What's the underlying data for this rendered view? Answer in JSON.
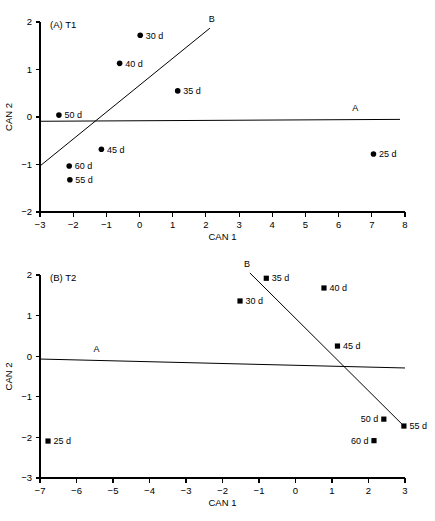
{
  "chart_data": [
    {
      "type": "scatter",
      "panel_id": "A",
      "panel_label": "(A) T1",
      "title": "(A) T1",
      "xlabel": "CAN 1",
      "ylabel": "CAN 2",
      "xlim": [
        -3,
        8
      ],
      "ylim": [
        -2,
        2
      ],
      "xticks": [
        -3,
        -2,
        -1,
        0,
        1,
        2,
        3,
        4,
        5,
        6,
        7,
        8
      ],
      "xticklabels": [
        "−3",
        "−2",
        "−1",
        "0",
        "1",
        "2",
        "3",
        "4",
        "5",
        "6",
        "7",
        "8"
      ],
      "yticks": [
        -2,
        -1,
        0,
        1,
        2
      ],
      "yticklabels": [
        "−2",
        "−1",
        "0",
        "1",
        "2"
      ],
      "grid": false,
      "legend": false,
      "marker": "circle",
      "points": [
        {
          "label": "25 d",
          "x": 7.05,
          "y": -0.78,
          "label_side": "right"
        },
        {
          "label": "30 d",
          "x": 0.02,
          "y": 1.72,
          "label_side": "right"
        },
        {
          "label": "35 d",
          "x": 1.15,
          "y": 0.55,
          "label_side": "right"
        },
        {
          "label": "40 d",
          "x": -0.6,
          "y": 1.13,
          "label_side": "right"
        },
        {
          "label": "45 d",
          "x": -1.15,
          "y": -0.68,
          "label_side": "right"
        },
        {
          "label": "50 d",
          "x": -2.43,
          "y": 0.04,
          "label_side": "right"
        },
        {
          "label": "55 d",
          "x": -2.1,
          "y": -1.32,
          "label_side": "right"
        },
        {
          "label": "60 d",
          "x": -2.12,
          "y": -1.03,
          "label_side": "right"
        }
      ],
      "vectors": [
        {
          "name": "A",
          "x1": -3.0,
          "y1": -0.09,
          "x2": 7.85,
          "y2": -0.05,
          "label": "A",
          "label_x": 6.5,
          "label_y": 0.12
        },
        {
          "name": "B",
          "x1": -2.98,
          "y1": -1.02,
          "x2": 2.12,
          "y2": 1.87,
          "label": "B",
          "label_x": 2.18,
          "label_y": 2.0
        }
      ]
    },
    {
      "type": "scatter",
      "panel_id": "B",
      "panel_label": "(B) T2",
      "title": "(B) T2",
      "xlabel": "CAN 1",
      "ylabel": "CAN 2",
      "xlim": [
        -7,
        3
      ],
      "ylim": [
        -3,
        2
      ],
      "xticks": [
        -7,
        -6,
        -5,
        -4,
        -3,
        -2,
        -1,
        0,
        1,
        2,
        3
      ],
      "xticklabels": [
        "−7",
        "−6",
        "−5",
        "−4",
        "−3",
        "−2",
        "−1",
        "0",
        "1",
        "2",
        "3"
      ],
      "yticks": [
        -3,
        -2,
        -1,
        0,
        1,
        2
      ],
      "yticklabels": [
        "−3",
        "−2",
        "−1",
        "0",
        "1",
        "2"
      ],
      "grid": false,
      "legend": false,
      "marker": "square",
      "points": [
        {
          "label": "25 d",
          "x": -6.78,
          "y": -2.09,
          "label_side": "right"
        },
        {
          "label": "30 d",
          "x": -1.52,
          "y": 1.36,
          "label_side": "right"
        },
        {
          "label": "35 d",
          "x": -0.8,
          "y": 1.92,
          "label_side": "right"
        },
        {
          "label": "40 d",
          "x": 0.78,
          "y": 1.68,
          "label_side": "right"
        },
        {
          "label": "45 d",
          "x": 1.15,
          "y": 0.25,
          "label_side": "right"
        },
        {
          "label": "50 d",
          "x": 2.42,
          "y": -1.55,
          "label_side": "left"
        },
        {
          "label": "55 d",
          "x": 2.97,
          "y": -1.72,
          "label_side": "right"
        },
        {
          "label": "60 d",
          "x": 2.15,
          "y": -2.08,
          "label_side": "left"
        }
      ],
      "vectors": [
        {
          "name": "A",
          "x1": -7.0,
          "y1": -0.07,
          "x2": 3.0,
          "y2": -0.29,
          "label": "A",
          "label_x": -5.45,
          "label_y": 0.1
        },
        {
          "name": "B",
          "x1": -1.25,
          "y1": 2.05,
          "x2": 2.97,
          "y2": -1.72,
          "label": "B",
          "label_x": -1.33,
          "label_y": 2.2
        }
      ]
    }
  ]
}
